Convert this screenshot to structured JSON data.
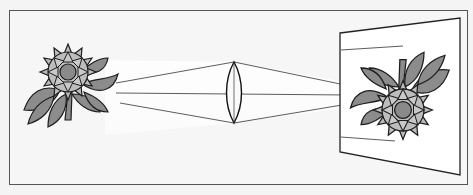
{
  "diagram": {
    "elements": [
      "object-flower",
      "light-rays",
      "convex-lens",
      "projection-screen",
      "inverted-image-flower"
    ],
    "colors": {
      "background": "#f4f4f4",
      "frame": "#555555",
      "leaf": "#8c8c8c",
      "petal": "#bdbdbd",
      "center": "#8a8a8a",
      "outline": "#1e1e1e",
      "screen": "#ffffff",
      "light_beam": "#ffffff"
    }
  }
}
